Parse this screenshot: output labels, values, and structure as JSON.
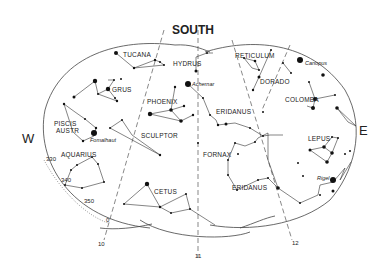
{
  "chart": {
    "title": "SOUTH",
    "directions": {
      "west": "W",
      "east": "E"
    },
    "hour_markers": [
      "10",
      "11",
      "12"
    ],
    "ecliptic_ticks": [
      "330",
      "340",
      "350",
      "0"
    ],
    "constellations": [
      {
        "name": "TUCANA"
      },
      {
        "name": "HYDRUS"
      },
      {
        "name": "RETICULUM"
      },
      {
        "name": "DORADO"
      },
      {
        "name": "GRUS"
      },
      {
        "name": "PHOENIX"
      },
      {
        "name": "COLOMBA"
      },
      {
        "name": "PISCIS AUSTR",
        "line1": "PISCIS",
        "line2": "AUSTR"
      },
      {
        "name": "SCULPTOR"
      },
      {
        "name": "ERIDANUS"
      },
      {
        "name": "FORNAX"
      },
      {
        "name": "LEPUS"
      },
      {
        "name": "AQUARIUS"
      },
      {
        "name": "CETUS"
      },
      {
        "name": "ERIDANUS"
      }
    ],
    "named_stars": [
      {
        "name": "Canopus"
      },
      {
        "name": "Achernar"
      },
      {
        "name": "Fomalhaut"
      },
      {
        "name": "Rigel"
      }
    ]
  }
}
